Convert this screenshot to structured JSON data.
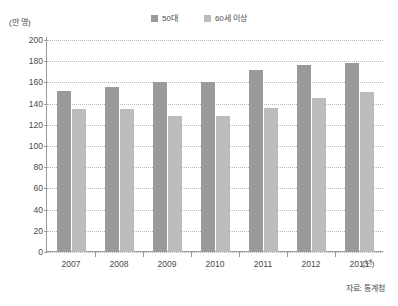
{
  "chart_data": {
    "type": "bar",
    "title": "",
    "subtitle": "",
    "xlabel": "(년)",
    "ylabel": "(만 명)",
    "categories": [
      "2007",
      "2008",
      "2009",
      "2010",
      "2011",
      "2012",
      "2013"
    ],
    "series": [
      {
        "name": "50대",
        "color": "#9a9a9a",
        "values": [
          152,
          156,
          160,
          160,
          172,
          176,
          178
        ]
      },
      {
        "name": "60세 이상",
        "color": "#bcbcbc",
        "values": [
          135,
          135,
          128,
          128,
          136,
          145,
          151
        ]
      }
    ],
    "ylim": [
      0,
      200
    ],
    "ytick_step": 20,
    "ytick_labels": [
      "200",
      "180",
      "160",
      "140",
      "120",
      "100",
      "80",
      "60",
      "40",
      "20",
      "0"
    ],
    "grid": true,
    "grid_axis": "y",
    "legend_position": "top-center",
    "annotations": [
      "자료: 통계청"
    ]
  },
  "legend": {
    "items": [
      {
        "label": "50대",
        "color": "#9a9a9a"
      },
      {
        "label": "60세 이상",
        "color": "#bcbcbc"
      }
    ]
  },
  "axes": {
    "y_unit": "(만 명)",
    "x_unit": "(년)"
  },
  "footer": {
    "source": "자료: 통계청"
  },
  "colors": {
    "series_1": "#9a9a9a",
    "series_2": "#bcbcbc",
    "grid": "#b9b9b9",
    "axis": "#9a9a9a",
    "text": "#4a4a4a",
    "background": "#ffffff"
  }
}
